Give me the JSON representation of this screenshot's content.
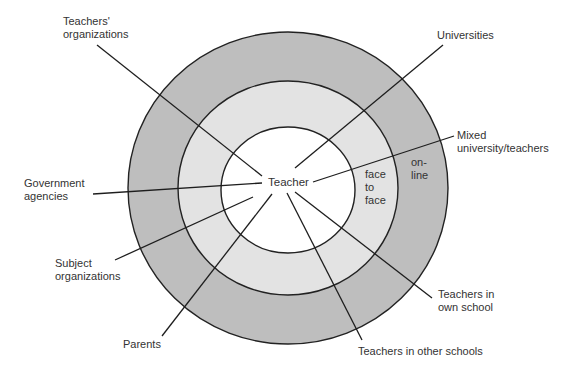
{
  "diagram": {
    "center": {
      "label": "Teacher"
    },
    "rings": [
      {
        "name": "outer",
        "color": "#bebebe",
        "label_lines": [
          "on-",
          "line"
        ]
      },
      {
        "name": "middle",
        "color": "#e3e3e3",
        "label_lines": [
          "face",
          "to",
          "face"
        ]
      },
      {
        "name": "inner",
        "color": "#ffffff"
      }
    ],
    "nodes": [
      {
        "id": "teachers-organizations",
        "lines": [
          "Teachers'",
          "organizations"
        ]
      },
      {
        "id": "universities",
        "lines": [
          "Universities"
        ]
      },
      {
        "id": "mixed-university-teachers",
        "lines": [
          "Mixed",
          "university/teachers"
        ]
      },
      {
        "id": "government-agencies",
        "lines": [
          "Government",
          "agencies"
        ]
      },
      {
        "id": "subject-organizations",
        "lines": [
          "Subject",
          "organizations"
        ]
      },
      {
        "id": "parents",
        "lines": [
          "Parents"
        ]
      },
      {
        "id": "teachers-in-other-schools",
        "lines": [
          "Teachers in other schools"
        ]
      },
      {
        "id": "teachers-in-own-school",
        "lines": [
          "Teachers in",
          "own school"
        ]
      }
    ]
  }
}
